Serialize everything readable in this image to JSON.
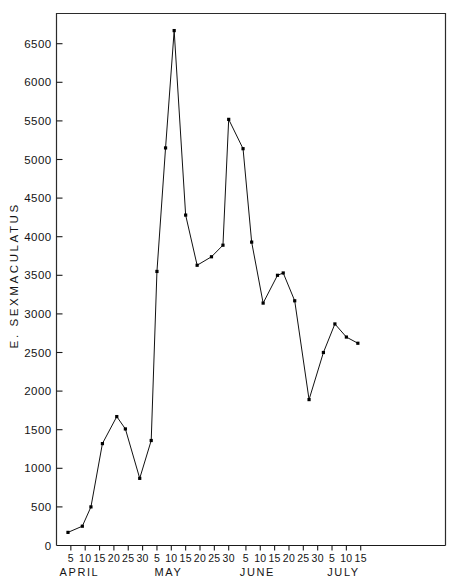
{
  "chart_data": {
    "type": "line",
    "title": "",
    "subtitle": "",
    "xlabel": "",
    "ylabel": "E. SEXMACULATUS",
    "ylim": [
      0,
      6850
    ],
    "xlim": [
      1,
      107
    ],
    "grid": false,
    "legend": null,
    "y_ticks": [
      0,
      500,
      1000,
      1500,
      2000,
      2500,
      3000,
      3500,
      4000,
      4500,
      5000,
      5500,
      6000,
      6500
    ],
    "y_tick_labels": [
      "0",
      "500",
      "1000",
      "1500",
      "2000",
      "2500",
      "3000",
      "3500",
      "4000",
      "4500",
      "5000",
      "5500",
      "6000",
      "6500"
    ],
    "x_tick_labels": [
      "5",
      "10",
      "15",
      "20",
      "25",
      "30",
      "5",
      "10",
      "15",
      "20",
      "25",
      "30",
      "5",
      "10",
      "15",
      "20",
      "25",
      "30",
      "5",
      "10",
      "15"
    ],
    "x_tick_days": [
      5,
      10,
      15,
      20,
      25,
      30,
      35,
      40,
      45,
      50,
      55,
      60,
      66,
      71,
      76,
      81,
      86,
      91,
      96,
      101,
      106
    ],
    "month_labels": [
      {
        "label": "APRIL",
        "day": 8
      },
      {
        "label": "MAY",
        "day": 39
      },
      {
        "label": "JUNE",
        "day": 70
      },
      {
        "label": "JULY",
        "day": 100
      }
    ],
    "x_day_offsets": {
      "april": 0,
      "may": 30,
      "june": 61,
      "july": 91
    },
    "series": [
      {
        "name": "E. sexmaculatus",
        "marker": "square",
        "color": "#000000",
        "points": [
          {
            "day": 4,
            "date": "April 4",
            "value": 170
          },
          {
            "day": 9,
            "date": "April 9",
            "value": 250
          },
          {
            "day": 12,
            "date": "April 12",
            "value": 500
          },
          {
            "day": 16,
            "date": "April 16",
            "value": 1320
          },
          {
            "day": 21,
            "date": "April 21",
            "value": 1670
          },
          {
            "day": 24,
            "date": "April 24",
            "value": 1510
          },
          {
            "day": 29,
            "date": "April 29",
            "value": 870
          },
          {
            "day": 33,
            "date": "May 3",
            "value": 1360
          },
          {
            "day": 35,
            "date": "May 5",
            "value": 3550
          },
          {
            "day": 38,
            "date": "May 8",
            "value": 5150
          },
          {
            "day": 41,
            "date": "May 11",
            "value": 6670
          },
          {
            "day": 45,
            "date": "May 15",
            "value": 4280
          },
          {
            "day": 49,
            "date": "May 19",
            "value": 3630
          },
          {
            "day": 54,
            "date": "May 24",
            "value": 3740
          },
          {
            "day": 58,
            "date": "May 28",
            "value": 3890
          },
          {
            "day": 60,
            "date": "May 30",
            "value": 5520
          },
          {
            "day": 65,
            "date": "June 4",
            "value": 5140
          },
          {
            "day": 68,
            "date": "June 7",
            "value": 3930
          },
          {
            "day": 72,
            "date": "June 11",
            "value": 3140
          },
          {
            "day": 77,
            "date": "June 16",
            "value": 3500
          },
          {
            "day": 79,
            "date": "June 18",
            "value": 3530
          },
          {
            "day": 83,
            "date": "June 22",
            "value": 3170
          },
          {
            "day": 88,
            "date": "June 27",
            "value": 1890
          },
          {
            "day": 93,
            "date": "July 2",
            "value": 2500
          },
          {
            "day": 97,
            "date": "July 6",
            "value": 2870
          },
          {
            "day": 101,
            "date": "July 10",
            "value": 2700
          },
          {
            "day": 105,
            "date": "July 14",
            "value": 2620
          }
        ]
      }
    ]
  },
  "figure": {
    "background_color": "#ffffff",
    "line_color": "#000000",
    "axis_color": "#1a1a1a"
  }
}
